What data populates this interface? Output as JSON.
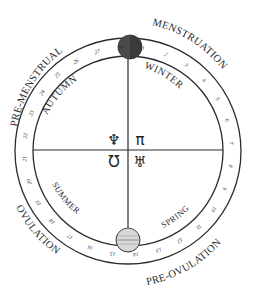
{
  "diagram": {
    "center": {
      "x": 128,
      "y": 151
    },
    "outer_radius": 113,
    "inner_radius": 95,
    "colors": {
      "line": "#2b2b2b",
      "dark_moon": "#4a4a4a",
      "full_moon": "#d8d8d8",
      "background": "#ffffff"
    },
    "phases": [
      {
        "label": "PRE-MENSTRUAL",
        "position": "upper-left"
      },
      {
        "label": "MENSTRUATION",
        "position": "upper-right"
      },
      {
        "label": "OVULATION",
        "position": "lower-left"
      },
      {
        "label": "PRE-OVULATION",
        "position": "lower-right"
      }
    ],
    "seasons": [
      {
        "label": "AUTUMN",
        "position": "upper-left"
      },
      {
        "label": "WINTER",
        "position": "upper-right"
      },
      {
        "label": "SUMMER",
        "position": "lower-left"
      },
      {
        "label": "SPRING",
        "position": "lower-right"
      }
    ],
    "days": [
      "1",
      "2",
      "3",
      "4",
      "5",
      "6",
      "7",
      "8",
      "9",
      "10",
      "11",
      "12",
      "13",
      "14",
      "15",
      "16",
      "17",
      "18",
      "19",
      "20",
      "21",
      "22",
      "23",
      "24",
      "25",
      "26",
      "27",
      "28"
    ],
    "moons": [
      {
        "name": "new-moon",
        "position": "top",
        "style": "dark"
      },
      {
        "name": "full-moon",
        "position": "bottom",
        "style": "light"
      }
    ],
    "center_symbols": [
      {
        "name": "neptune-like-symbol",
        "glyph": "♆",
        "quadrant": "upper-left"
      },
      {
        "name": "pi-like-symbol",
        "glyph": "π",
        "quadrant": "upper-right"
      },
      {
        "name": "omega-like-symbol",
        "glyph": "Ʊ",
        "quadrant": "lower-left"
      },
      {
        "name": "uranus-like-symbol",
        "glyph": "♅",
        "quadrant": "lower-right"
      }
    ]
  }
}
